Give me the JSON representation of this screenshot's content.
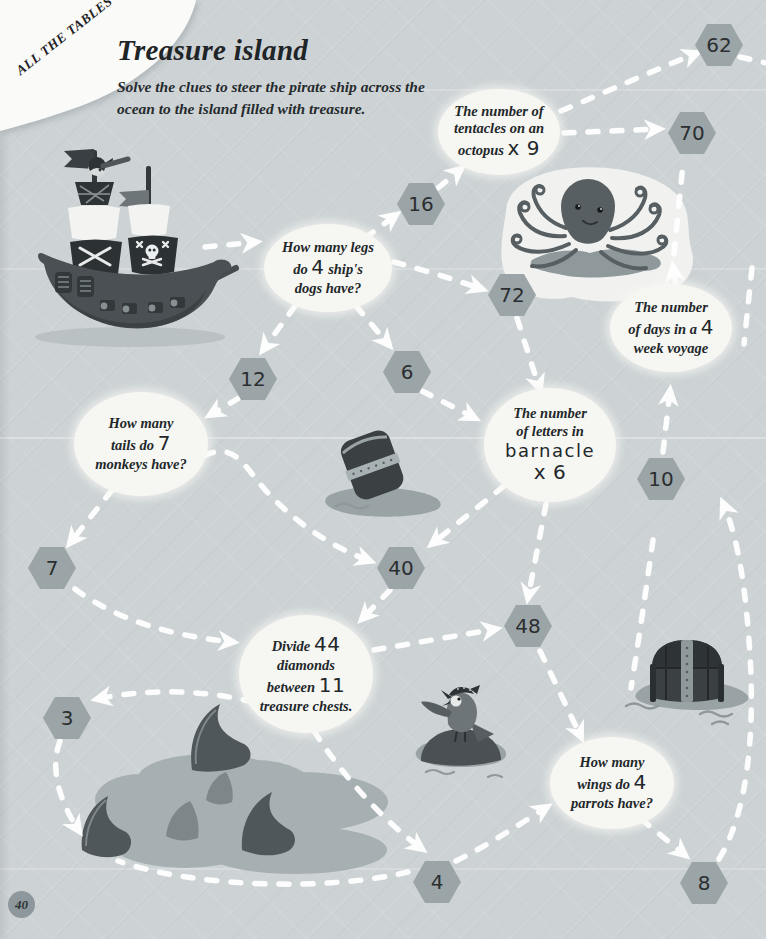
{
  "page": {
    "corner_tag": "ALL THE TABLES",
    "title": "Treasure island",
    "subtitle_line1": "Solve the clues to steer the pirate ship across the",
    "subtitle_line2": "ocean to the island filled with treasure.",
    "page_number": "40"
  },
  "clues": {
    "octopus": {
      "l1": "The number of",
      "l2": "tentacles on an",
      "l3a": "octopus ",
      "l3b": "x 9"
    },
    "legs": {
      "l1": "How many legs",
      "l2a": "do ",
      "l2b": "4",
      "l2c": " ship's",
      "l3": "dogs have?"
    },
    "days": {
      "l1": "The number",
      "l2a": "of days in a ",
      "l2b": "4",
      "l3": "week voyage"
    },
    "monkeys": {
      "l1": "How many",
      "l2a": "tails do ",
      "l2b": "7",
      "l3": "monkeys have?"
    },
    "barnacle": {
      "l1": "The number",
      "l2": "of letters in",
      "l3": "barnacle",
      "l4": "x 6"
    },
    "divide": {
      "l1a": "Divide ",
      "l1b": "44",
      "l2": "diamonds",
      "l3a": "between ",
      "l3b": "11",
      "l4": "treasure chests."
    },
    "wings": {
      "l1": "How many",
      "l2a": "wings do ",
      "l2b": "4",
      "l3": "parrots have?"
    }
  },
  "hexagons": [
    {
      "id": "hex-62",
      "value": "62"
    },
    {
      "id": "hex-70",
      "value": "70"
    },
    {
      "id": "hex-16",
      "value": "16"
    },
    {
      "id": "hex-72",
      "value": "72"
    },
    {
      "id": "hex-12",
      "value": "12"
    },
    {
      "id": "hex-6",
      "value": "6"
    },
    {
      "id": "hex-10",
      "value": "10"
    },
    {
      "id": "hex-7",
      "value": "7"
    },
    {
      "id": "hex-40",
      "value": "40"
    },
    {
      "id": "hex-48",
      "value": "48"
    },
    {
      "id": "hex-3",
      "value": "3"
    },
    {
      "id": "hex-4",
      "value": "4"
    },
    {
      "id": "hex-8",
      "value": "8"
    }
  ],
  "illustrations": [
    "pirate-ship",
    "octopus",
    "floating-barrel",
    "shark-infested-water",
    "parrot-on-rock",
    "treasure-chest"
  ],
  "colors": {
    "background": "#cdd3d5",
    "hexagon": "#9ba4a7",
    "bubble": "#f6f6f2",
    "arrow": "#ffffff",
    "ink": "#22272a",
    "illustration_dark": "#4a5053",
    "illustration_mid": "#6d7578",
    "water": "#99a2a5",
    "water_blob": "#a6afb2"
  }
}
